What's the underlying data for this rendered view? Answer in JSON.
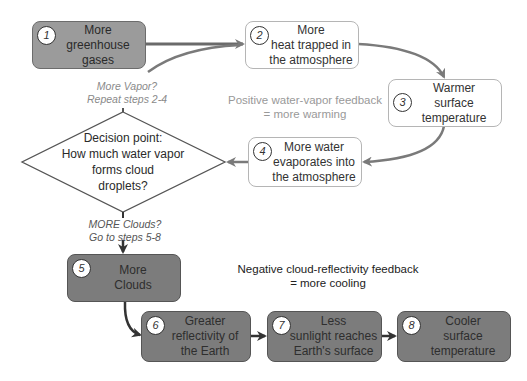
{
  "diagram": {
    "colors": {
      "step_gray_light": "#9b9b9b",
      "step_gray_dark": "#7c7c7c",
      "step_white": "#ffffff",
      "arrow_gray": "#7a7a7a",
      "arrow_dark": "#333333",
      "positive_note": "#999999",
      "negative_note": "#222222"
    },
    "steps": [
      {
        "number": "1",
        "text": "More\ngreenhouse\ngases"
      },
      {
        "number": "2",
        "text": "More\nheat trapped in\nthe atmosphere"
      },
      {
        "number": "3",
        "text": "Warmer\nsurface\ntemperature"
      },
      {
        "number": "4",
        "text": "More water\nevaporates into\nthe atmosphere"
      },
      {
        "number": "5",
        "text": "More\nClouds"
      },
      {
        "number": "6",
        "text": "Greater\nreflectivity of\nthe Earth"
      },
      {
        "number": "7",
        "text": "Less\nsunlight reaches\nEarth's surface"
      },
      {
        "number": "8",
        "text": "Cooler\nsurface\ntemperature"
      }
    ],
    "decision": {
      "text": "Decision point:\nHow much water vapor\nforms cloud\ndroplets?"
    },
    "branches": {
      "more_vapor": "More Vapor?\nRepeat steps 2-4",
      "more_clouds": "MORE Clouds?\nGo to steps 5-8"
    },
    "feedback_notes": {
      "positive": "Positive water-vapor feedback\n= more warming",
      "negative": "Negative cloud-reflectivity feedback\n= more cooling"
    }
  }
}
